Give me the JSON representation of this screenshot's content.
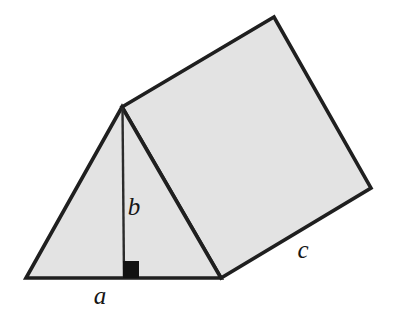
{
  "figure": {
    "type": "geometry-diagram",
    "width": 399,
    "height": 318,
    "background_color": "#ffffff"
  },
  "colors": {
    "face_fill": "#e3e3e3",
    "outline": "#1f1f1f",
    "altitude_stroke": "#2b2b2b",
    "right_angle_fill": "#111111",
    "label_color": "#161616"
  },
  "shapes": {
    "front_triangle": {
      "name": "front-triangular-face",
      "points": "26,278 122,107 221,278",
      "fill": "#e3e3e3",
      "stroke": "#1f1f1f",
      "stroke_width": 3.6
    },
    "top_rectangle": {
      "name": "slanted-rectangular-face",
      "points": "122,107 274,17 371,188 221,278",
      "fill": "#e3e3e3",
      "stroke": "#1f1f1f",
      "stroke_width": 3.6
    },
    "altitude": {
      "name": "altitude-segment",
      "x1": 122.5,
      "y1": 108,
      "x2": 124,
      "y2": 278,
      "stroke": "#2b2b2b",
      "stroke_width": 2.4
    },
    "right_angle_marker": {
      "name": "right-angle-square",
      "x": 123,
      "y": 261,
      "width": 16,
      "height": 17,
      "fill": "#111111"
    }
  },
  "labels": [
    {
      "id": "label-a",
      "text": "a",
      "meaning": "base-length",
      "x": 100,
      "y": 295,
      "font_size": 25
    },
    {
      "id": "label-b",
      "text": "b",
      "meaning": "triangle-height",
      "x": 134,
      "y": 206,
      "font_size": 25
    },
    {
      "id": "label-c",
      "text": "c",
      "meaning": "prism-length",
      "x": 303,
      "y": 249,
      "font_size": 25
    }
  ]
}
